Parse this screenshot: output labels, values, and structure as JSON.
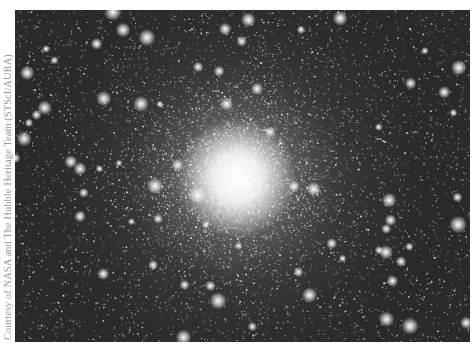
{
  "photo": {
    "subject": "globular star cluster",
    "alt": "Hubble image of a dense globular star cluster with a bright core",
    "colors": {
      "background": "#2a2a2a",
      "core": "#ffffff",
      "star": "#f2f2f2"
    },
    "core_center": {
      "x": 222,
      "y": 168
    },
    "core_radius": 60,
    "halo_radius": 240,
    "star_count": 9000,
    "bright_star_count": 70,
    "seed": 13
  },
  "credit": {
    "text": "Courtesy of NASA and The Hubble Heritage Team (STScI/AURA)",
    "color": "#9a9a9a"
  }
}
